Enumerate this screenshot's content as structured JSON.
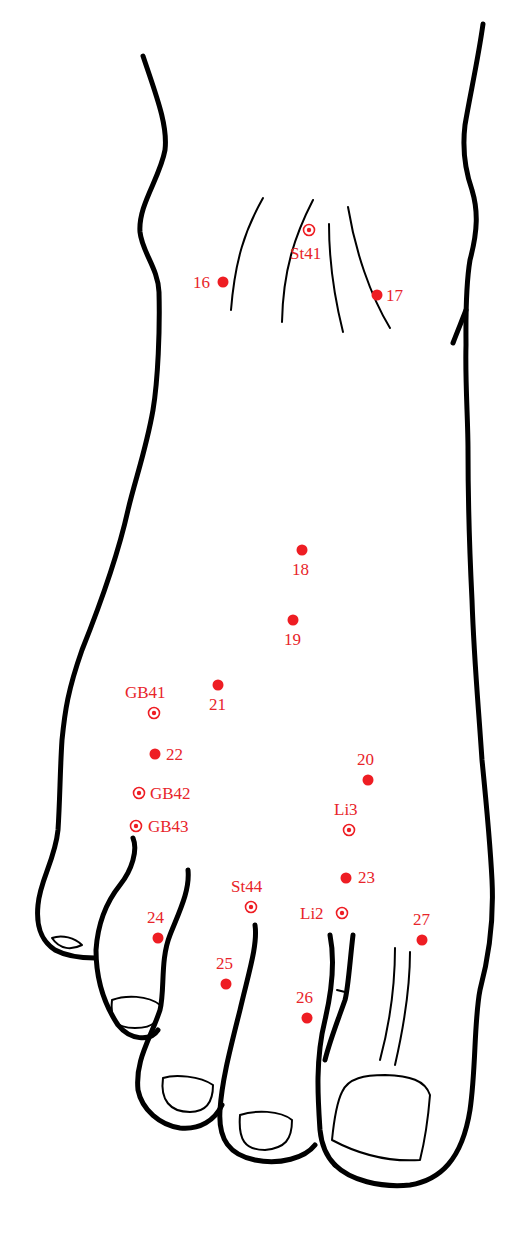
{
  "diagram": {
    "colors": {
      "outline": "#000000",
      "points": "#ee1d23"
    },
    "points": [
      {
        "id": "St41",
        "label": "St41",
        "type": "ring",
        "x": 309,
        "y": 230,
        "lx": 290,
        "ly": 259
      },
      {
        "id": "16",
        "label": "16",
        "type": "dot",
        "x": 223,
        "y": 282,
        "lx": 193,
        "ly": 288
      },
      {
        "id": "17",
        "label": "17",
        "type": "dot",
        "x": 377,
        "y": 295,
        "lx": 386,
        "ly": 301
      },
      {
        "id": "18",
        "label": "18",
        "type": "dot",
        "x": 302,
        "y": 550,
        "lx": 292,
        "ly": 575
      },
      {
        "id": "19",
        "label": "19",
        "type": "dot",
        "x": 293,
        "y": 620,
        "lx": 284,
        "ly": 645
      },
      {
        "id": "21",
        "label": "21",
        "type": "dot",
        "x": 218,
        "y": 685,
        "lx": 209,
        "ly": 710
      },
      {
        "id": "GB41",
        "label": "GB41",
        "type": "ring",
        "x": 154,
        "y": 713,
        "lx": 125,
        "ly": 698
      },
      {
        "id": "22",
        "label": "22",
        "type": "dot",
        "x": 155,
        "y": 754,
        "lx": 166,
        "ly": 760
      },
      {
        "id": "20",
        "label": "20",
        "type": "dot",
        "x": 368,
        "y": 780,
        "lx": 357,
        "ly": 765
      },
      {
        "id": "GB42",
        "label": "GB42",
        "type": "ring",
        "x": 139,
        "y": 793,
        "lx": 150,
        "ly": 799
      },
      {
        "id": "Li3",
        "label": "Li3",
        "type": "ring",
        "x": 349,
        "y": 830,
        "lx": 334,
        "ly": 815
      },
      {
        "id": "GB43",
        "label": "GB43",
        "type": "ring",
        "x": 136,
        "y": 826,
        "lx": 148,
        "ly": 832
      },
      {
        "id": "23",
        "label": "23",
        "type": "dot",
        "x": 346,
        "y": 878,
        "lx": 358,
        "ly": 883
      },
      {
        "id": "St44",
        "label": "St44",
        "type": "ring",
        "x": 251,
        "y": 907,
        "lx": 231,
        "ly": 892
      },
      {
        "id": "Li2",
        "label": "Li2",
        "type": "ring",
        "x": 342,
        "y": 913,
        "lx": 300,
        "ly": 919
      },
      {
        "id": "24",
        "label": "24",
        "type": "dot",
        "x": 158,
        "y": 938,
        "lx": 147,
        "ly": 923
      },
      {
        "id": "27",
        "label": "27",
        "type": "dot",
        "x": 422,
        "y": 940,
        "lx": 413,
        "ly": 925
      },
      {
        "id": "25",
        "label": "25",
        "type": "dot",
        "x": 226,
        "y": 984,
        "lx": 216,
        "ly": 969
      },
      {
        "id": "26",
        "label": "26",
        "type": "dot",
        "x": 307,
        "y": 1018,
        "lx": 296,
        "ly": 1003
      }
    ]
  }
}
